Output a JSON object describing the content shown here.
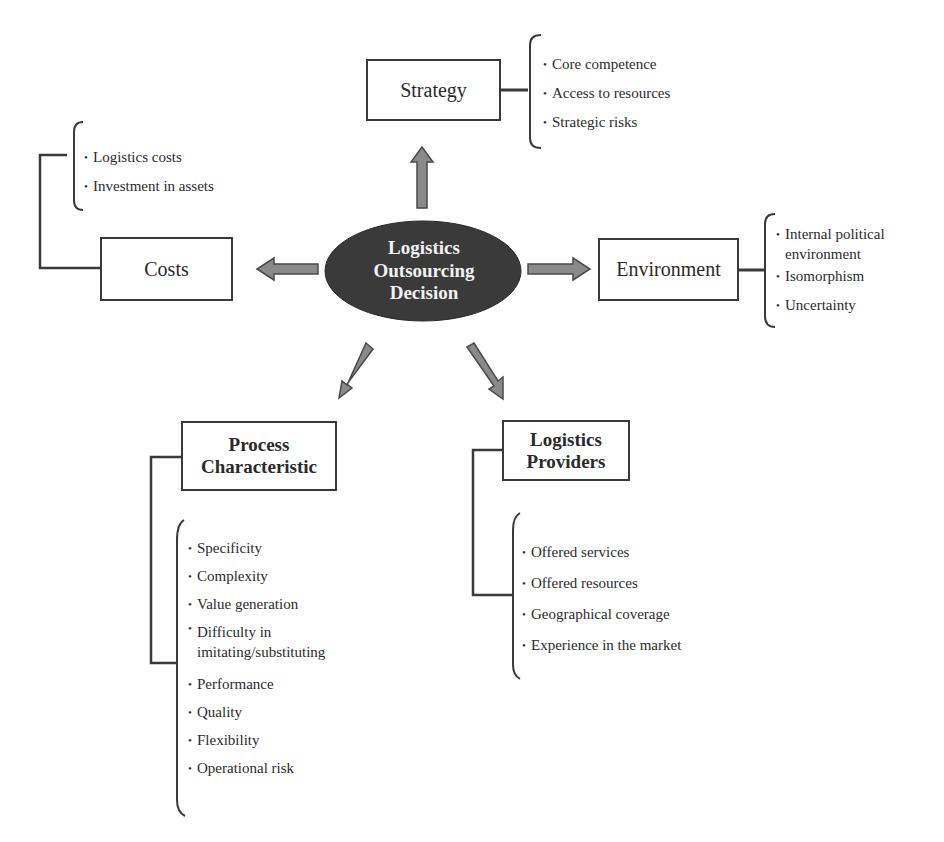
{
  "center": {
    "label_lines": [
      "Logistics",
      "Outsourcing",
      "Decision"
    ],
    "fill": "#3a3a3a",
    "text_color": "#f2f2f2"
  },
  "arrow_color": "#8a8a8a",
  "nodes": {
    "strategy": {
      "title": "Strategy",
      "items": [
        "Core competence",
        "Access to resources",
        "Strategic risks"
      ]
    },
    "costs": {
      "title": "Costs",
      "items": [
        "Logistics costs",
        "Investment in assets"
      ]
    },
    "environment": {
      "title": "Environment",
      "items": [
        "Internal political environment",
        "Isomorphism",
        "Uncertainty"
      ]
    },
    "process": {
      "title_lines": [
        "Process",
        "Characteristic"
      ],
      "items": [
        "Specificity",
        "Complexity",
        "Value generation",
        "Difficulty in imitating/substituting",
        "Performance",
        "Quality",
        "Flexibility",
        "Operational risk"
      ]
    },
    "providers": {
      "title_lines": [
        "Logistics",
        "Providers"
      ],
      "items": [
        "Offered services",
        "Offered resources",
        "Geographical coverage",
        "Experience in the market"
      ]
    }
  }
}
